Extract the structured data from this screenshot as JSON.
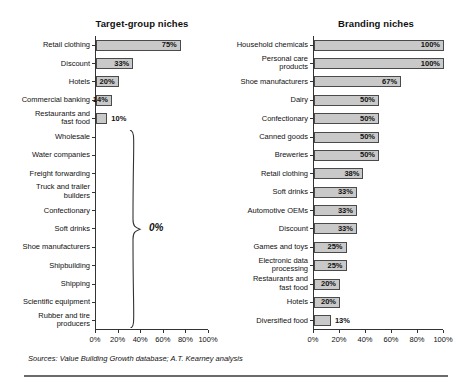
{
  "figure": {
    "sources": "Sources: Value Building Growth database; A.T. Kearney analysis",
    "bar_fill": "#c9c9c9",
    "bar_stroke": "#4a4a4a",
    "axis_color": "#333333",
    "rule_color": "#6b6b6b"
  },
  "chart_data": [
    {
      "type": "bar",
      "orientation": "horizontal",
      "title": "Target-group niches",
      "xlabel": "",
      "ylabel": "",
      "xlim": [
        0,
        100
      ],
      "xticks": [
        0,
        20,
        40,
        60,
        80,
        100
      ],
      "xticklabels": [
        "0%",
        "20%",
        "40%",
        "60%",
        "80%",
        "100%"
      ],
      "grid": false,
      "legend": null,
      "value_suffix": "%",
      "categories": [
        "Retail clothing",
        "Discount",
        "Hotels",
        "Commercial banking",
        "Restaurants and\nfast food",
        "Wholesale",
        "Water companies",
        "Freight forwarding",
        "Truck and trailer\nbuilders",
        "Confectionary",
        "Soft drinks",
        "Shoe manufacturers",
        "Shipbuilding",
        "Shipping",
        "Scientific equipment",
        "Rubber and tire\nproducers"
      ],
      "values": [
        75,
        33,
        20,
        14,
        10,
        0,
        0,
        0,
        0,
        0,
        0,
        0,
        0,
        0,
        0,
        0
      ],
      "labels": [
        "75%",
        "33%",
        "20%",
        "14%",
        "10%",
        "",
        "",
        "",
        "",
        "",
        "",
        "",
        "",
        "",
        "",
        ""
      ],
      "label_inside": [
        true,
        true,
        true,
        true,
        false,
        false,
        false,
        false,
        false,
        false,
        false,
        false,
        false,
        false,
        false,
        false
      ],
      "annotation": {
        "text": "0%",
        "covers_categories": [
          "Wholesale",
          "Water companies",
          "Freight forwarding",
          "Truck and trailer builders",
          "Confectionary",
          "Soft drinks",
          "Shoe manufacturers",
          "Shipbuilding",
          "Shipping",
          "Scientific equipment",
          "Rubber and tire producers"
        ]
      }
    },
    {
      "type": "bar",
      "orientation": "horizontal",
      "title": "Branding niches",
      "xlabel": "",
      "ylabel": "",
      "xlim": [
        0,
        100
      ],
      "xticks": [
        0,
        20,
        40,
        60,
        80,
        100
      ],
      "xticklabels": [
        "0%",
        "20%",
        "40%",
        "60%",
        "80%",
        "100%"
      ],
      "grid": false,
      "legend": null,
      "value_suffix": "%",
      "categories": [
        "Household chemicals",
        "Personal care products",
        "Shoe manufacturers",
        "Dairy",
        "Confectionary",
        "Canned goods",
        "Breweries",
        "Retail clothing",
        "Soft drinks",
        "Automotive OEMs",
        "Discount",
        "Games and toys",
        "Electronic data\nprocessing",
        "Restaurants and\nfast food",
        "Hotels",
        "Diversified food"
      ],
      "values": [
        100,
        100,
        67,
        50,
        50,
        50,
        50,
        38,
        33,
        33,
        33,
        25,
        25,
        20,
        20,
        13
      ],
      "labels": [
        "100%",
        "100%",
        "67%",
        "50%",
        "50%",
        "50%",
        "50%",
        "38%",
        "33%",
        "33%",
        "33%",
        "25%",
        "25%",
        "20%",
        "20%",
        "13%"
      ],
      "label_inside": [
        true,
        true,
        true,
        true,
        true,
        true,
        true,
        true,
        true,
        true,
        true,
        true,
        true,
        true,
        true,
        false
      ]
    }
  ]
}
